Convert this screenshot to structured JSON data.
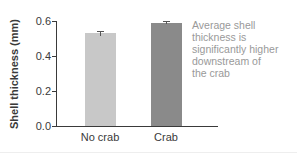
{
  "chart_data": {
    "type": "bar",
    "title": "",
    "xlabel": "",
    "ylabel": "Shell thickness (mm)",
    "ylim": [
      0,
      0.6
    ],
    "yticks": [
      "0.0",
      "0.2",
      "0.4",
      "0.6"
    ],
    "categories": [
      "No crab",
      "Crab"
    ],
    "values": [
      0.53,
      0.59
    ],
    "error": [
      0.015,
      0.008
    ],
    "colors": [
      "#c8c8c8",
      "#8a8a8a"
    ],
    "grid": false,
    "legend": null,
    "annotation": "Average shell thickness is significantly higher downstream of the crab"
  },
  "labels": {
    "ylabel": "Shell thickness (mm)",
    "yticks": [
      "0.6",
      "0.4",
      "0.2",
      "0.0"
    ],
    "categories": [
      "No crab",
      "Crab"
    ],
    "annotation_lines": [
      "Average shell",
      "thickness is",
      "significantly higher",
      "downstream of",
      "the crab"
    ]
  }
}
